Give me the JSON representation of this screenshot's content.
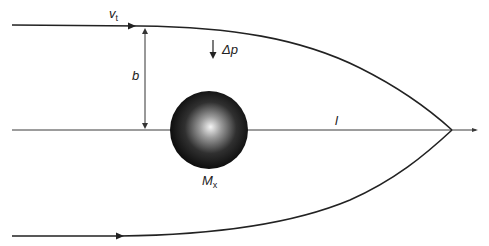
{
  "diagram": {
    "labels": {
      "velocity": "v",
      "velocity_sub": "t",
      "momentum_change": "Δp",
      "impact_parameter": "b",
      "distance": "l",
      "mass": "M",
      "mass_sub": "x"
    },
    "colors": {
      "line": "#2a2a2a",
      "sphere_dark": "#0d0d0d",
      "sphere_highlight": "#f2f2f2",
      "background": "#ffffff"
    },
    "elements": [
      {
        "type": "trajectory",
        "label": "upper ray",
        "from": [
          14,
          25
        ],
        "to": [
          452,
          130
        ]
      },
      {
        "type": "trajectory",
        "label": "lower ray",
        "from": [
          14,
          236
        ],
        "to": [
          452,
          130
        ]
      },
      {
        "type": "axis",
        "label": "optical axis",
        "from": [
          14,
          130
        ],
        "to": [
          476,
          130
        ]
      },
      {
        "type": "dimension",
        "label": "b",
        "from": [
          145,
          26
        ],
        "to": [
          145,
          130
        ]
      },
      {
        "type": "arrow",
        "label": "Δp",
        "direction": "down"
      },
      {
        "type": "sphere",
        "label": "M_x",
        "center": [
          209,
          130
        ],
        "radius": 39
      }
    ]
  }
}
